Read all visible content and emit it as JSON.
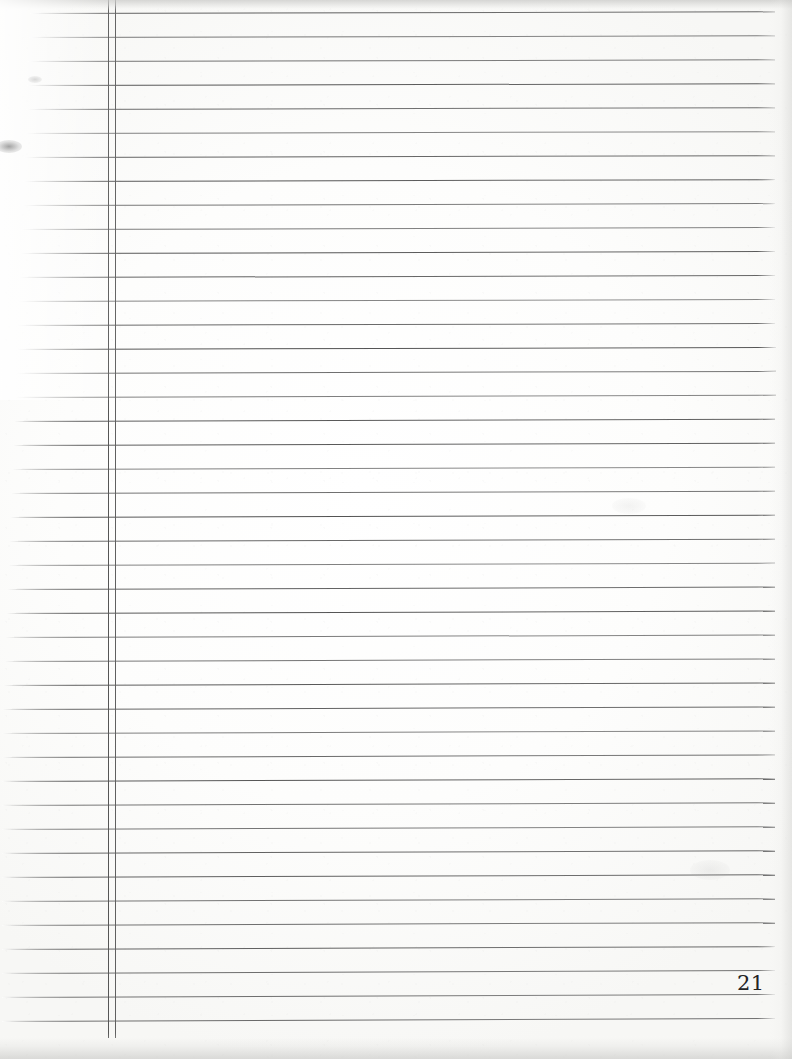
{
  "document": {
    "kind": "scanned-lined-notebook-page",
    "page_number": "21",
    "content_text": "",
    "width": 792,
    "height": 1059
  },
  "colors": {
    "paper": "#fdfdfc",
    "rule_line": "#6e6e6e",
    "margin_line": "#565656",
    "page_number_ink": "#242424",
    "scan_shadow": "#cdcdcb"
  },
  "ruling": {
    "line_count": 43,
    "line_spacing_px": 24,
    "first_line_y": 13,
    "last_line_y": 1026,
    "line_thickness_px": 1,
    "slope_rise_px": -3,
    "right_end_x": 775,
    "left_start_x_top": 30,
    "left_start_x_bottom": 2
  },
  "margin_rule": {
    "outer_x": 108,
    "inner_x": 115,
    "top_y": 0,
    "bottom_y": 1038,
    "style": "double-vertical"
  },
  "scan_artifacts": {
    "top_band_label": "scanner edge shadow top",
    "bottom_band_label": "scanner edge shadow bottom",
    "right_band_label": "scanner edge shadow right",
    "left_washout_label": "overexposed left margin",
    "smudge_label": "ink smudge near left edge"
  },
  "annotations": {
    "body_note": "page is blank — no handwriting present"
  }
}
